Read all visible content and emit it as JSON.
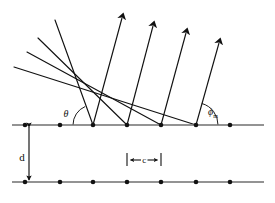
{
  "figure": {
    "type": "physics-ray-diagram",
    "background_color": "#ffffff",
    "stroke_color": "#111111",
    "canvas": {
      "width": 275,
      "height": 203
    }
  },
  "labels": {
    "incidence_angle": "θ",
    "diffraction_angle_base": "ϕ",
    "diffraction_angle_subscript": "m",
    "plane_separation": "d",
    "atom_spacing": "c"
  },
  "lattice": {
    "top_plane": {
      "name": "upper atomic plane",
      "y": 125,
      "x_start": 12,
      "x_end": 264,
      "atom_x": [
        25,
        60,
        93,
        127,
        161,
        196,
        230
      ]
    },
    "bottom_plane": {
      "name": "lower atomic plane",
      "y": 182,
      "x_start": 12,
      "x_end": 264,
      "atom_x": [
        25,
        60,
        93,
        127,
        161,
        196,
        230
      ]
    },
    "scattering_atom_x": [
      93,
      127,
      161,
      196
    ]
  },
  "incoming_rays": [
    {
      "x1": 55,
      "y1": 20,
      "x2": 93,
      "y2": 125
    },
    {
      "x1": 38,
      "y1": 38,
      "x2": 127,
      "y2": 125
    },
    {
      "x1": 27,
      "y1": 52,
      "x2": 161,
      "y2": 125
    },
    {
      "x1": 14,
      "y1": 67,
      "x2": 196,
      "y2": 125
    }
  ],
  "outgoing_rays": [
    {
      "x1": 93,
      "y1": 125,
      "x2": 122,
      "y2": 14
    },
    {
      "x1": 127,
      "y1": 125,
      "x2": 153,
      "y2": 22
    },
    {
      "x1": 161,
      "y1": 125,
      "x2": 186,
      "y2": 29
    },
    {
      "x1": 196,
      "y1": 125,
      "x2": 219,
      "y2": 39
    }
  ],
  "angle_markers": {
    "theta": {
      "vertex_x": 93,
      "vertex_y": 125,
      "label_x": 66,
      "label_y": 116
    },
    "phi_m": {
      "vertex_x": 196,
      "vertex_y": 125,
      "label_x": 213,
      "label_y": 113
    }
  },
  "dimension_markers": {
    "d": {
      "x": 29,
      "y_top": 125,
      "y_bottom": 182,
      "label_x": 22,
      "label_y": 158
    },
    "c": {
      "x_left": 127,
      "x_right": 161,
      "y": 160,
      "label_x": 144,
      "label_y": 163
    }
  }
}
